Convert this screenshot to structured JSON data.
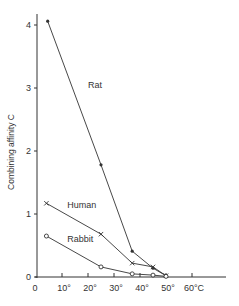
{
  "chart_data": {
    "type": "line",
    "title": "",
    "xlabel": "",
    "ylabel": "Combining affinity C",
    "xlim": [
      0,
      70
    ],
    "ylim": [
      0,
      4.2
    ],
    "grid": false,
    "legend": "inline labels",
    "x_ticks": [
      {
        "value": 0,
        "label": "0"
      },
      {
        "value": 10,
        "label": "10°"
      },
      {
        "value": 20,
        "label": "20°"
      },
      {
        "value": 30,
        "label": "30°"
      },
      {
        "value": 40,
        "label": "40°"
      },
      {
        "value": 50,
        "label": "50°"
      },
      {
        "value": 60,
        "label": "60°C"
      }
    ],
    "y_ticks": [
      {
        "value": 0,
        "label": "0"
      },
      {
        "value": 1,
        "label": "1"
      },
      {
        "value": 2,
        "label": "2"
      },
      {
        "value": 3,
        "label": "3"
      },
      {
        "value": 4,
        "label": "4"
      }
    ],
    "series": [
      {
        "name": "Rat",
        "marker": "filled-dot",
        "label_pos": [
          20,
          3.0
        ],
        "points": [
          [
            4.5,
            4.06
          ],
          [
            25,
            1.78
          ],
          [
            37,
            0.41
          ],
          [
            45,
            0.14
          ],
          [
            50,
            0.02
          ]
        ]
      },
      {
        "name": "Human",
        "marker": "cross",
        "label_pos": [
          12,
          1.1
        ],
        "points": [
          [
            4,
            1.17
          ],
          [
            25,
            0.68
          ],
          [
            37,
            0.22
          ],
          [
            45,
            0.16
          ],
          [
            50,
            0.02
          ]
        ]
      },
      {
        "name": "Rabbit",
        "marker": "open-circle",
        "label_pos": [
          12,
          0.55
        ],
        "points": [
          [
            4,
            0.65
          ],
          [
            25,
            0.16
          ],
          [
            37,
            0.05
          ],
          [
            45,
            0.03
          ],
          [
            50,
            0.01
          ]
        ]
      }
    ]
  },
  "colors": {
    "line": "#333333",
    "background": "#ffffff"
  }
}
